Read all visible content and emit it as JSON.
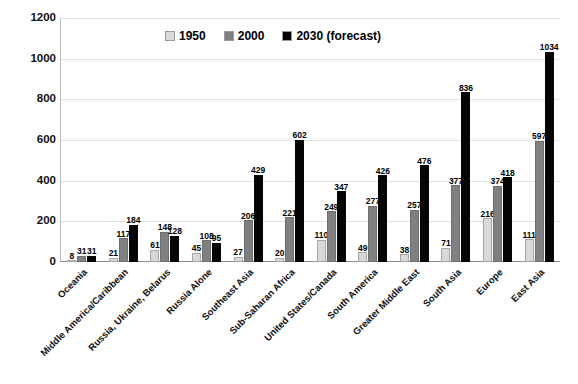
{
  "chart_data": {
    "type": "bar",
    "title": "",
    "xlabel": "",
    "ylabel": "",
    "ylim": [
      0,
      1200
    ],
    "yticks": [
      0,
      200,
      400,
      600,
      800,
      1000,
      1200
    ],
    "grid": true,
    "legend_position": "top-center",
    "categories": [
      "Oceania",
      "Middle America/Caribbean",
      "Russia, Ukraine, Belarus",
      "Russia Alone",
      "Southeast Asia",
      "Sub-Saharan Africa",
      "United States/Canada",
      "South America",
      "Greater Middle East",
      "South Asia",
      "Europe",
      "East Asia"
    ],
    "series": [
      {
        "name": "1950",
        "color": "#d9d9d9",
        "values": [
          8,
          21,
          61,
          45,
          27,
          20,
          110,
          49,
          38,
          71,
          216,
          111
        ]
      },
      {
        "name": "2000",
        "color": "#808080",
        "values": [
          31,
          117,
          148,
          108,
          206,
          221,
          249,
          277,
          257,
          377,
          374,
          597
        ]
      },
      {
        "name": "2030 (forecast)",
        "color": "#050505",
        "values": [
          31,
          184,
          128,
          95,
          429,
          602,
          347,
          426,
          476,
          836,
          418,
          1034
        ]
      }
    ]
  },
  "legend": {
    "items": [
      {
        "label": "1950",
        "color": "#d9d9d9"
      },
      {
        "label": "2000",
        "color": "#808080"
      },
      {
        "label": "2030 (forecast)",
        "color": "#050505"
      }
    ]
  }
}
